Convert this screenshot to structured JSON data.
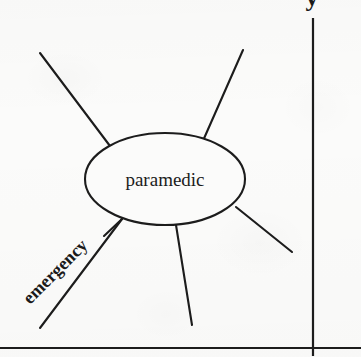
{
  "figure": {
    "type": "radial-node-diagram",
    "background_color": "#fbfbfa",
    "ink_color": "#1c1c1c",
    "central_node": {
      "label": "paramedic",
      "shape": "ellipse",
      "cx": 165,
      "cy": 179,
      "rx": 80,
      "ry": 46,
      "font_size": 19
    },
    "edge_labels": [
      {
        "name": "emergency-edge-label",
        "text": "emergency",
        "rotation_deg": -45,
        "x": 30,
        "y": 305,
        "font_size": 18
      }
    ],
    "rays": [
      {
        "name": "ray-upper-left",
        "x1": 110,
        "y1": 146,
        "x2": 40,
        "y2": 53
      },
      {
        "name": "ray-upper-right",
        "x1": 202,
        "y1": 143,
        "x2": 243,
        "y2": 50
      },
      {
        "name": "ray-right-lower",
        "x1": 236,
        "y1": 207,
        "x2": 292,
        "y2": 252
      },
      {
        "name": "ray-bottom",
        "x1": 176,
        "y1": 225,
        "x2": 192,
        "y2": 325
      },
      {
        "name": "ray-emergency",
        "x1": 122,
        "y1": 219,
        "x2": 40,
        "y2": 328
      },
      {
        "name": "ray-lower-left-stub",
        "x1": 122,
        "y1": 219,
        "x2": 104,
        "y2": 236
      }
    ],
    "axes": {
      "vertical_line": {
        "name": "vertical-axis-line",
        "x": 313,
        "y1": 18,
        "y2": 356
      },
      "horizontal_line": {
        "name": "horizontal-axis-line",
        "y": 348,
        "x1": 0,
        "x2": 361
      }
    },
    "clipped_glyph": {
      "name": "clipped-descender-glyph",
      "text": "y",
      "x": 312,
      "y": 6,
      "font_size": 26,
      "note": "letter cut off by top edge of crop"
    }
  }
}
